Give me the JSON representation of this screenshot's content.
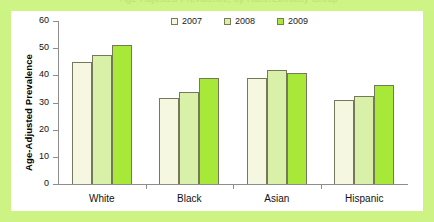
{
  "figure": {
    "panel_bg": "#ffffff",
    "border_color": "#ccf383",
    "axis_color": "#8d8d8d",
    "title_ghost": "Age-Adjusted Prevalence, by Race/Ethnicity Group"
  },
  "legend": {
    "position": "top-center",
    "items": [
      {
        "label": "2007",
        "color": "#f5f7e0"
      },
      {
        "label": "2008",
        "color": "#d8f0a8"
      },
      {
        "label": "2009",
        "color": "#a8e838"
      }
    ]
  },
  "chart_data": {
    "type": "bar",
    "title": "",
    "xlabel": "",
    "ylabel": "Age-Adjusted Prevalence",
    "ylim": [
      0,
      60
    ],
    "yticks": [
      0,
      10,
      20,
      30,
      40,
      50,
      60
    ],
    "grid": false,
    "categories": [
      "White",
      "Black",
      "Asian",
      "Hispanic"
    ],
    "series": [
      {
        "name": "2007",
        "color": "#f5f7e0",
        "values": [
          45,
          31.5,
          39,
          31
        ]
      },
      {
        "name": "2008",
        "color": "#d8f0a8",
        "values": [
          47.5,
          34,
          42,
          32.5
        ]
      },
      {
        "name": "2009",
        "color": "#a8e838",
        "values": [
          51,
          39,
          41,
          36.5
        ]
      }
    ]
  }
}
